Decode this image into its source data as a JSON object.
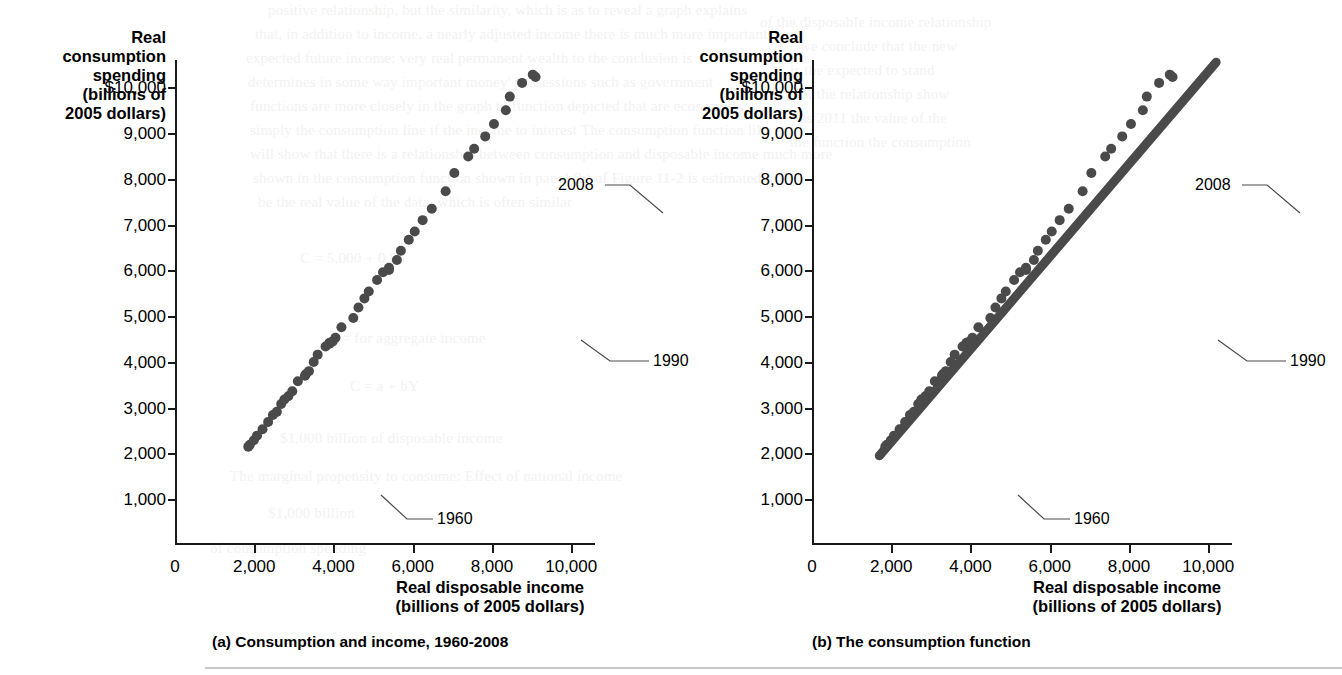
{
  "figure": {
    "bottom_rule": "horizontal-rule"
  },
  "ghost_text": [
    {
      "x": 268,
      "y": 2,
      "text": "positive relationship, but the similarity, which is as to reveal a graph explains"
    },
    {
      "x": 255,
      "y": 26,
      "text": "that, in addition to income, a nearly adjusted income there is much more important"
    },
    {
      "x": 246,
      "y": 50,
      "text": "expected future income; very real permanent wealth to the conclusion is"
    },
    {
      "x": 248,
      "y": 74,
      "text": "determines in some way important money' possessions such as government"
    },
    {
      "x": 250,
      "y": 98,
      "text": "functions are more closely in the graph to function depicted that are economists"
    },
    {
      "x": 250,
      "y": 122,
      "text": "simply the consumption line if the income to interest The consumption function like"
    },
    {
      "x": 250,
      "y": 146,
      "text": "will show that there is a relationship between consumption and disposable income much more"
    },
    {
      "x": 253,
      "y": 170,
      "text": "shown in the consumption function shown in panel (b) of Figure 11-2 is estimated to"
    },
    {
      "x": 258,
      "y": 194,
      "text": "be the real value of the data, which is often similar"
    },
    {
      "x": 300,
      "y": 250,
      "text": "C = 5,000 + 0.85"
    },
    {
      "x": 330,
      "y": 330,
      "text": "$ = for aggregate income"
    },
    {
      "x": 350,
      "y": 378,
      "text": "C = a + bY"
    },
    {
      "x": 280,
      "y": 430,
      "text": "$1,000 billion of disposable income"
    },
    {
      "x": 230,
      "y": 468,
      "text": "The marginal propensity to consume: Effect of national income"
    },
    {
      "x": 268,
      "y": 505,
      "text": "$1,000 billion"
    },
    {
      "x": 210,
      "y": 540,
      "text": "of consumption spending"
    },
    {
      "x": 760,
      "y": 14,
      "text": "of the disposable income relationship"
    },
    {
      "x": 800,
      "y": 38,
      "text": "we conclude that the new"
    },
    {
      "x": 790,
      "y": 62,
      "text": "is the expected to stand"
    },
    {
      "x": 800,
      "y": 86,
      "text": "of the relationship show"
    },
    {
      "x": 800,
      "y": 110,
      "text": "as 2011 the value of the"
    },
    {
      "x": 790,
      "y": 134,
      "text": "the function the consumption"
    }
  ],
  "panels": [
    {
      "id": "a",
      "caption": "(a)  Consumption and income, 1960-2008",
      "y_axis_title": "Real\nconsumption\nspending\n(billions of\n2005 dollars)",
      "x_axis_title": "Real disposable income\n(billions of 2005 dollars)",
      "show_trendline": false,
      "annotations": [
        {
          "name": "annotation-2008",
          "label": "2008",
          "label_x": 383,
          "label_y": 116,
          "leader": "M 430 125 L 455 125 L 488 153"
        },
        {
          "name": "annotation-1990",
          "label": "1990",
          "label_x": 478,
          "label_y": 292,
          "leader": "M 474 301 L 435 301 L 406 280"
        },
        {
          "name": "annotation-1960",
          "label": "1960",
          "label_x": 262,
          "label_y": 450,
          "leader": "M 258 459 L 232 459 L 206 435"
        }
      ]
    },
    {
      "id": "b",
      "caption": "(b)  The consumption function",
      "y_axis_title": "Real\nconsumption\nspending\n(billions of\n2005 dollars)",
      "x_axis_title": "Real disposable income\n(billions of 2005 dollars)",
      "show_trendline": true,
      "annotations": [
        {
          "name": "annotation-2008",
          "label": "2008",
          "label_x": 383,
          "label_y": 116,
          "leader": "M 430 125 L 455 125 L 488 153"
        },
        {
          "name": "annotation-1990",
          "label": "1990",
          "label_x": 478,
          "label_y": 292,
          "leader": "M 474 301 L 435 301 L 406 280"
        },
        {
          "name": "annotation-1960",
          "label": "1960",
          "label_x": 262,
          "label_y": 450,
          "leader": "M 258 459 L 232 459 L 206 435"
        }
      ]
    }
  ],
  "chart_data": {
    "type": "scatter",
    "xlabel": "Real disposable income (billions of 2005 dollars)",
    "ylabel": "Real consumption spending (billions of 2005 dollars)",
    "xlim": [
      0,
      10600
    ],
    "ylim": [
      0,
      10600
    ],
    "xticks": [
      0,
      2000,
      4000,
      6000,
      8000,
      10000
    ],
    "xticklabels": [
      "0",
      "2,000",
      "4,000",
      "6,000",
      "8,000",
      "10,000"
    ],
    "yticks": [
      1000,
      2000,
      3000,
      4000,
      5000,
      6000,
      7000,
      8000,
      9000,
      10000
    ],
    "yticklabels": [
      "1,000",
      "2,000",
      "3,000",
      "4,000",
      "5,000",
      "6,000",
      "7,000",
      "8,000",
      "9,000",
      "$10,000"
    ],
    "grid": false,
    "legend": null,
    "marker_color": "#4a4a4a",
    "series_name": "Disposable income vs consumption spending, annual 1960-2008",
    "years": [
      1960,
      1961,
      1962,
      1963,
      1964,
      1965,
      1966,
      1967,
      1968,
      1969,
      1970,
      1971,
      1972,
      1973,
      1974,
      1975,
      1976,
      1977,
      1978,
      1979,
      1980,
      1981,
      1982,
      1983,
      1984,
      1985,
      1986,
      1987,
      1988,
      1989,
      1990,
      1991,
      1992,
      1993,
      1994,
      1995,
      1996,
      1997,
      1998,
      1999,
      2000,
      2001,
      2002,
      2003,
      2004,
      2005,
      2006,
      2007,
      2008
    ],
    "x": [
      1850,
      1890,
      1990,
      2070,
      2210,
      2350,
      2470,
      2570,
      2680,
      2760,
      2860,
      2960,
      3100,
      3300,
      3280,
      3380,
      3500,
      3600,
      3800,
      3900,
      3900,
      3980,
      4050,
      4200,
      4500,
      4630,
      4780,
      4890,
      5100,
      5250,
      5400,
      5400,
      5600,
      5700,
      5900,
      6050,
      6250,
      6480,
      6830,
      7050,
      7400,
      7550,
      7830,
      8050,
      8350,
      8450,
      8760,
      9030,
      9100
    ],
    "y": [
      2150,
      2190,
      2290,
      2390,
      2530,
      2690,
      2840,
      2910,
      3080,
      3180,
      3250,
      3360,
      3580,
      3730,
      3700,
      3800,
      4000,
      4160,
      4340,
      4420,
      4400,
      4450,
      4530,
      4760,
      4960,
      5190,
      5390,
      5540,
      5790,
      5960,
      6060,
      6010,
      6230,
      6430,
      6670,
      6850,
      7100,
      7350,
      7730,
      8130,
      8490,
      8660,
      8930,
      9200,
      9500,
      9800,
      10100,
      10280,
      10230
    ],
    "panel_b_trendline": {
      "x": [
        1700,
        10200
      ],
      "y": [
        1950,
        10550
      ],
      "description": "fitted consumption function line through the scatter"
    }
  }
}
